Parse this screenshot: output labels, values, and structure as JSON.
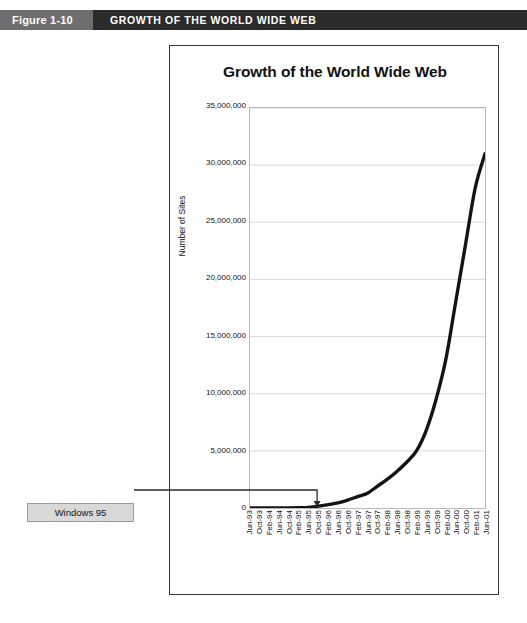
{
  "figure": {
    "number": "Figure 1-10",
    "caption": "GROWTH OF THE WORLD WIDE WEB"
  },
  "callout": {
    "label": "Windows 95",
    "points_to_category": "Oct-95"
  },
  "colors": {
    "header_dark": "#2b2b2b",
    "header_gray": "#6e6e6e",
    "header_text": "#ffffff",
    "line": "#141414",
    "plot_border": "#b9b9b9",
    "gridline": "#d8d8d8",
    "callout_fill": "#d9d9d9"
  },
  "chart_data": {
    "type": "line",
    "title": "Growth of the World Wide Web",
    "xlabel": "",
    "ylabel": "Number of Sites",
    "ylim": [
      0,
      35000000
    ],
    "yticks": [
      0,
      5000000,
      10000000,
      15000000,
      20000000,
      25000000,
      30000000,
      35000000
    ],
    "ytick_labels": [
      "0",
      "5,000,000",
      "10,000,000",
      "15,000,000",
      "20,000,000",
      "25,000,000",
      "30,000,000",
      "35,000,000"
    ],
    "grid": true,
    "legend": null,
    "categories": [
      "Jun-93",
      "Oct-93",
      "Feb-94",
      "Jun-94",
      "Oct-94",
      "Feb-95",
      "Jun-95",
      "Oct-95",
      "Feb-96",
      "Jun-96",
      "Oct-96",
      "Feb-97",
      "Jun-97",
      "Oct-97",
      "Feb-98",
      "Jun-98",
      "Oct-98",
      "Feb-99",
      "Jun-99",
      "Oct-99",
      "Feb-00",
      "Jun-00",
      "Oct-00",
      "Feb-01",
      "Jun-01"
    ],
    "values": [
      130,
      600,
      2700,
      6000,
      10000,
      27000,
      60000,
      160000,
      300000,
      450000,
      700000,
      1000000,
      1300000,
      1900000,
      2500000,
      3200000,
      4000000,
      5000000,
      6800000,
      9500000,
      13000000,
      18000000,
      23000000,
      28000000,
      31000000
    ],
    "series_name": "Number of Sites",
    "annotations": [
      {
        "text": "Windows 95",
        "at_category": "Oct-95",
        "at_value": 160000
      }
    ]
  }
}
